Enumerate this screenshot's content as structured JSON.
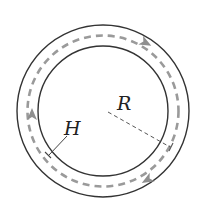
{
  "diagram": {
    "labels": {
      "radius": "R",
      "thickness": "H"
    },
    "geometry": {
      "center": [
        103,
        111
      ],
      "outer_radius": 86,
      "inner_radius": 65,
      "path_radius": 76
    },
    "flow_direction": "clockwise",
    "arrows": [
      "top-right",
      "left",
      "bottom-right"
    ],
    "colors": {
      "stroke": "#333333",
      "dashed_path": "#9a9a9a",
      "radius_line": "#555555"
    }
  }
}
